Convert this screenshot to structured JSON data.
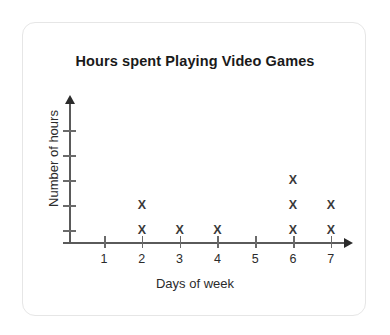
{
  "card": {
    "border_color": "#e6e6e6",
    "background": "#ffffff"
  },
  "chart_data": {
    "type": "scatter",
    "title": "Hours spent Playing Video Games",
    "xlabel": "Days of week",
    "ylabel": "Number of hours",
    "categories": [
      "1",
      "2",
      "3",
      "4",
      "5",
      "6",
      "7"
    ],
    "values": [
      0,
      2,
      1,
      1,
      0,
      3,
      2
    ],
    "marker": "X",
    "marker_color": "#3a3a3a",
    "axis_color": "#5a5a5a",
    "grid": false,
    "legend": null,
    "xlim": [
      1,
      7
    ],
    "ylim": [
      0,
      5
    ],
    "y_tick_count": 5,
    "y_tick_labels": [
      "",
      "",
      "",
      "",
      ""
    ],
    "x_tick_labels": [
      "1",
      "2",
      "3",
      "4",
      "5",
      "6",
      "7"
    ],
    "points": [
      {
        "day": "2",
        "hour_level": 1
      },
      {
        "day": "2",
        "hour_level": 2
      },
      {
        "day": "3",
        "hour_level": 1
      },
      {
        "day": "4",
        "hour_level": 1
      },
      {
        "day": "6",
        "hour_level": 1
      },
      {
        "day": "6",
        "hour_level": 2
      },
      {
        "day": "6",
        "hour_level": 3
      },
      {
        "day": "7",
        "hour_level": 1
      },
      {
        "day": "7",
        "hour_level": 2
      }
    ]
  }
}
